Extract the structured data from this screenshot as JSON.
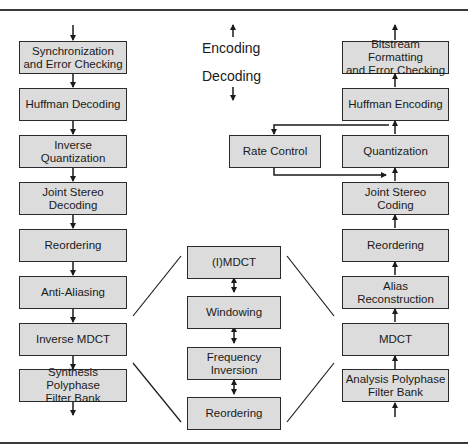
{
  "legend": {
    "encoding_label": "Encoding",
    "decoding_label": "Decoding"
  },
  "decoder_column": {
    "direction": "down",
    "blocks": [
      {
        "label": "Synchronization\nand Error Checking"
      },
      {
        "label": "Huffman Decoding"
      },
      {
        "label": "Inverse\nQuantization"
      },
      {
        "label": "Joint Stereo\nDecoding"
      },
      {
        "label": "Reordering"
      },
      {
        "label": "Anti-Aliasing"
      },
      {
        "label": "Inverse MDCT"
      },
      {
        "label": "Synthesis Polyphase\nFilter Bank"
      }
    ]
  },
  "encoder_column": {
    "direction": "up",
    "blocks": [
      {
        "label": "Bitstream Formatting\nand Error Checking"
      },
      {
        "label": "Huffman Encoding"
      },
      {
        "label": "Quantization"
      },
      {
        "label": "Joint Stereo\nCoding"
      },
      {
        "label": "Reordering"
      },
      {
        "label": "Alias\nReconstruction"
      },
      {
        "label": "MDCT"
      },
      {
        "label": "Analysis Polyphase\nFilter Bank"
      }
    ]
  },
  "rate_control": {
    "label": "Rate Control"
  },
  "mdct_detail": {
    "blocks": [
      {
        "label": "(I)MDCT"
      },
      {
        "label": "Windowing"
      },
      {
        "label": "Frequency\nInversion"
      },
      {
        "label": "Reordering"
      }
    ]
  },
  "colors": {
    "box_fill": "#dcdcdc",
    "stroke": "#2a2a2a"
  }
}
